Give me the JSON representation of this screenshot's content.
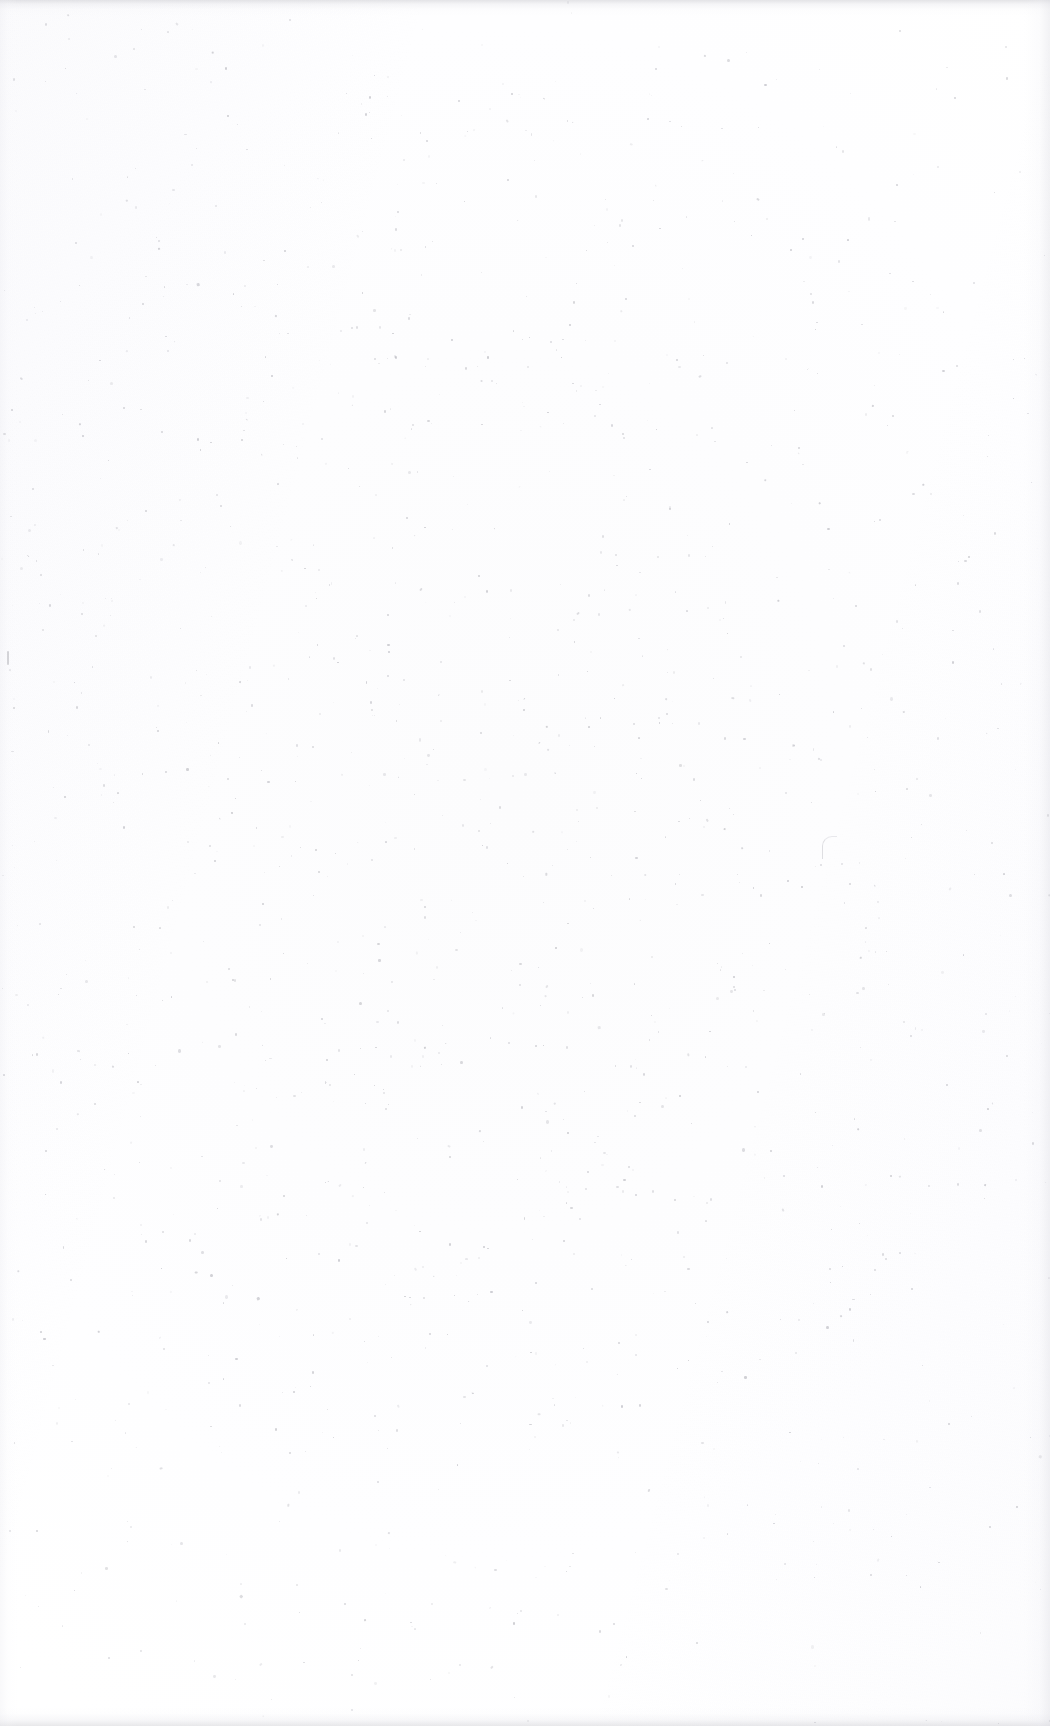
{
  "page": {
    "kind": "blank-scanned-page",
    "content_text": "",
    "width": 1050,
    "height": 1726
  },
  "colors": {
    "paper": "#fefefe",
    "paper_center": "#fcfcfd",
    "speckle": "#8f8f99",
    "edge_artifact": "#cdcdd2"
  },
  "artifacts": {
    "top_band_label": "",
    "bottom_band_label": "",
    "right_edge_label": "",
    "left_edge_label": ""
  },
  "speckles": {
    "seed": 20240917,
    "count": 1450,
    "density_center_x": 0.46,
    "density_center_y": 0.5,
    "min_size": 0.7,
    "max_size": 2.6,
    "min_opacity": 0.06,
    "max_opacity": 0.42
  }
}
